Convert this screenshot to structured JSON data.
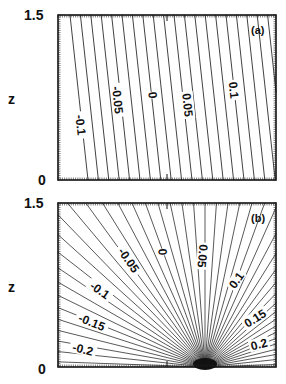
{
  "chart_data": [
    {
      "type": "line",
      "panel_label": "(a)",
      "ylabel": "z",
      "ytick_labels": [
        "0",
        "1.5"
      ],
      "ylim": [
        0,
        1.5
      ],
      "description": "Contours: nearly straight, slightly tilted parallel lines",
      "contour_labels": [
        {
          "text": "-0.1",
          "value": -0.1
        },
        {
          "text": "-0.05",
          "value": -0.05
        },
        {
          "text": "0",
          "value": 0
        },
        {
          "text": "0.05",
          "value": 0.05
        },
        {
          "text": "0.1",
          "value": 0.1
        }
      ],
      "contour_interval": 0.01,
      "n_lines": 21
    },
    {
      "type": "line",
      "panel_label": "(b)",
      "ylabel": "z",
      "ytick_labels": [
        "0",
        "1.5"
      ],
      "ylim": [
        0,
        1.5
      ],
      "description": "Contours: lines radiating from a focus point on the bottom boundary",
      "contour_labels": [
        {
          "text": "-0.2",
          "value": -0.2
        },
        {
          "text": "-0.15",
          "value": -0.15
        },
        {
          "text": "-0.1",
          "value": -0.1
        },
        {
          "text": "-0.05",
          "value": -0.05
        },
        {
          "text": "0",
          "value": 0
        },
        {
          "text": "0.05",
          "value": 0.05
        },
        {
          "text": "0.1",
          "value": 0.1
        },
        {
          "text": "0.15",
          "value": 0.15
        },
        {
          "text": "0.2",
          "value": 0.2
        }
      ],
      "contour_interval": 0.01,
      "n_lines": 45
    }
  ],
  "panels": {
    "a": {
      "label": "(a)",
      "ylabel": "z",
      "ytop": "1.5",
      "ybottom": "0"
    },
    "b": {
      "label": "(b)",
      "ylabel": "z",
      "ytop": "1.5",
      "ybottom": "0"
    }
  }
}
